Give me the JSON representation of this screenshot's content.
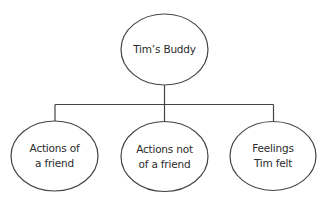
{
  "diagram": {
    "type": "tree",
    "stroke_color": "#444444",
    "text_color": "#2b2b2b",
    "background": "#ffffff",
    "top_edge_fragment": "",
    "root": {
      "id": "root",
      "label": "Tim’s Buddy",
      "lines": [
        "Tim’s Buddy"
      ],
      "shape": "ellipse",
      "cx": 164.5,
      "cy": 49.5,
      "rx": 43.5,
      "ry": 35.5
    },
    "connector": {
      "trunk": {
        "x": 164.5,
        "y1": 85,
        "y2": 104.5
      },
      "bar": {
        "y": 104.5,
        "x1": 55,
        "x2": 273.5
      },
      "drops": [
        {
          "x": 55,
          "y1": 104.5,
          "y2": 121
        },
        {
          "x": 164.5,
          "y1": 104.5,
          "y2": 121.5
        },
        {
          "x": 273.5,
          "y1": 104.5,
          "y2": 121
        }
      ]
    },
    "children": [
      {
        "id": "actions-of-a-friend",
        "label": "Actions of a friend",
        "lines": [
          "Actions of",
          "a friend"
        ],
        "shape": "ellipse",
        "cx": 54.5,
        "cy": 156,
        "rx": 43.5,
        "ry": 35
      },
      {
        "id": "actions-not-of-a-friend",
        "label": "Actions not of a friend",
        "lines": [
          "Actions not",
          "of a friend"
        ],
        "shape": "ellipse",
        "cx": 164.5,
        "cy": 156.5,
        "rx": 43.5,
        "ry": 35
      },
      {
        "id": "feelings-tim-felt",
        "label": "Feelings Tim felt",
        "lines": [
          "Feelings",
          "Tim felt"
        ],
        "shape": "ellipse",
        "cx": 273,
        "cy": 156,
        "rx": 43,
        "ry": 34.5
      }
    ]
  }
}
